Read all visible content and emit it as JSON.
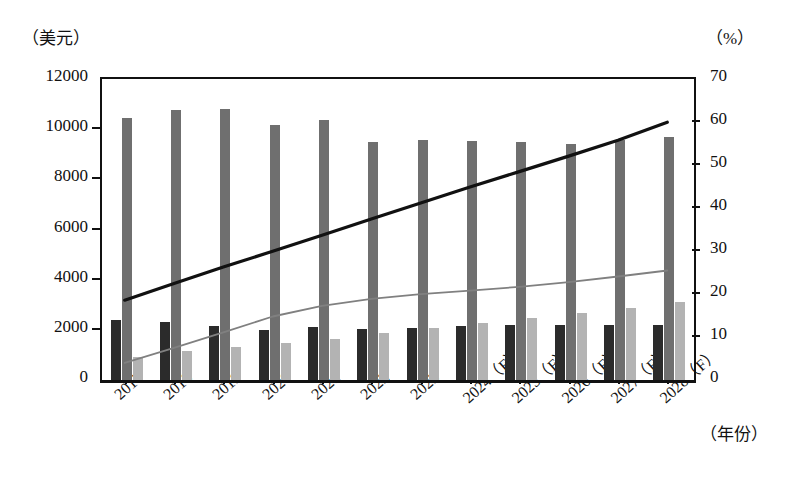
{
  "axes": {
    "left_unit": "（美元）",
    "right_unit": "（%）",
    "x_unit": "（年份）",
    "left_ticks": [
      "0",
      "2000",
      "4000",
      "6000",
      "8000",
      "10000",
      "12000"
    ],
    "right_ticks": [
      "0",
      "10",
      "20",
      "30",
      "40",
      "50",
      "60",
      "70"
    ]
  },
  "chart_data": {
    "type": "bar",
    "title": "",
    "subtitle": "",
    "xlabel": "（年份）",
    "ylabel": "（美元）",
    "y2label": "（%）",
    "ylim": [
      0,
      12000
    ],
    "y2lim": [
      0,
      70
    ],
    "grid": false,
    "legend_position": "none",
    "categories": [
      "2017",
      "2018",
      "2019",
      "2020",
      "2021",
      "2022",
      "2023",
      "2024（F）",
      "2025（F）",
      "2026（F）",
      "2027（F）",
      "2028（F）"
    ],
    "series": [
      {
        "name": "dark-bar-series",
        "kind": "bar",
        "axis": "left",
        "color": "#2b2b2b",
        "values": [
          2400,
          2300,
          2150,
          1980,
          2100,
          2050,
          2080,
          2150,
          2200,
          2200,
          2200,
          2200
        ]
      },
      {
        "name": "tall-bar-series",
        "kind": "bar",
        "axis": "left",
        "color": "#6f6f6f",
        "values": [
          10450,
          10750,
          10800,
          10150,
          10350,
          9500,
          9550,
          9520,
          9500,
          9400,
          9550,
          9680
        ]
      },
      {
        "name": "light-bar-series",
        "kind": "bar",
        "axis": "left",
        "color": "#b3b3b3",
        "values": [
          900,
          1150,
          1300,
          1480,
          1620,
          1870,
          2080,
          2280,
          2460,
          2680,
          2880,
          3120
        ]
      },
      {
        "name": "black-line-series",
        "kind": "line",
        "axis": "right",
        "color": "#111111",
        "values": [
          18.1,
          22.0,
          25.8,
          29.5,
          33.2,
          37.0,
          40.7,
          44.4,
          48.0,
          51.6,
          55.3,
          59.5
        ]
      },
      {
        "name": "gray-line-series",
        "kind": "line",
        "axis": "right",
        "color": "#808080",
        "values": [
          3.5,
          7.0,
          10.6,
          14.3,
          16.8,
          18.4,
          19.5,
          20.3,
          21.2,
          22.3,
          23.6,
          25.0
        ]
      }
    ]
  }
}
